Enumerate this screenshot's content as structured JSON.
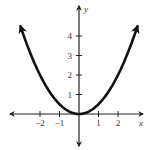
{
  "chart_data": {
    "type": "line",
    "title": "",
    "xlabel": "x",
    "ylabel": "y",
    "function": "y = x^2 / 2",
    "xlim": [
      -3,
      3
    ],
    "ylim": [
      -1.5,
      5
    ],
    "grid": false,
    "legend": null,
    "x_ticks": [
      -2,
      -1,
      1,
      2
    ],
    "x_tick_labels": [
      "−2",
      "−1",
      "1",
      "2"
    ],
    "y_ticks": [
      1,
      2,
      3,
      4
    ],
    "y_tick_labels": [
      "1",
      "2",
      "3",
      "4"
    ],
    "series": [
      {
        "name": "parabola",
        "color": "#111111",
        "x": [
          -3,
          -2.5,
          -2,
          -1.5,
          -1,
          -0.5,
          0,
          0.5,
          1,
          1.5,
          2,
          2.5,
          3
        ],
        "y": [
          4.5,
          3.125,
          2,
          1.125,
          0.5,
          0.125,
          0,
          0.125,
          0.5,
          1.125,
          2,
          3.125,
          4.5
        ]
      }
    ],
    "arrows": "both curve ends and all four axis ends have arrowheads"
  },
  "colors": {
    "background": "#ffffff",
    "curve": "#111111",
    "axes": "#222222",
    "text": "#333333"
  }
}
